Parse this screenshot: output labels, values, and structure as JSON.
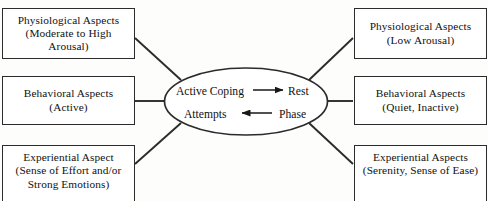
{
  "figure": {
    "type": "hub-and-spoke concept diagram",
    "background_color": "#fdfdfc",
    "stroke_color": "#2b2b2b"
  },
  "hub": {
    "shape": "ellipse",
    "top_row": {
      "source": "Active Coping",
      "arrow": "arrow-right",
      "target": "Rest"
    },
    "bottom_row": {
      "source": "Phase",
      "arrow": "arrow-left",
      "target": "Attempts"
    },
    "full_left_phrase": "Active Coping Attempts",
    "full_right_phrase": "Rest Phase"
  },
  "left_nodes": [
    {
      "title": "Physiological Aspects",
      "detail_line_1": "(Moderate to High",
      "detail_line_2": "Arousal)"
    },
    {
      "title": "Behavioral Aspects",
      "detail_line_1": "(Active)",
      "detail_line_2": ""
    },
    {
      "title": "Experiential Aspect",
      "detail_line_1": "(Sense of Effort and/or",
      "detail_line_2": "Strong Emotions)"
    }
  ],
  "right_nodes": [
    {
      "title": "Physiological Aspects",
      "detail_line_1": "(Low Arousal)",
      "detail_line_2": ""
    },
    {
      "title": "Behavioral Aspects",
      "detail_line_1": "(Quiet, Inactive)",
      "detail_line_2": ""
    },
    {
      "title": "Experiential Aspects",
      "detail_line_1": "(Serenity, Sense of Ease)",
      "detail_line_2": ""
    }
  ]
}
